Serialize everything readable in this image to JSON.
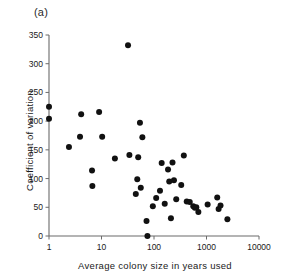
{
  "panel": {
    "label": "(a)"
  },
  "chart_data": {
    "type": "scatter",
    "title": "",
    "subtitle": "",
    "xlabel": "Average colony size in years used",
    "ylabel": "Coefficient of variation",
    "xscale": "log",
    "yscale": "linear",
    "xlim": [
      1,
      10000
    ],
    "ylim": [
      0,
      350
    ],
    "xticks": [
      1,
      10,
      100,
      1000,
      10000
    ],
    "xtick_labels": [
      "1",
      "10",
      "100",
      "1000",
      "10000"
    ],
    "yticks": [
      0,
      50,
      100,
      150,
      200,
      250,
      300,
      350
    ],
    "ytick_labels": [
      "0",
      "50",
      "100",
      "150",
      "200",
      "250",
      "300",
      "350"
    ],
    "grid": false,
    "legend": null,
    "marker": "filled-circle",
    "marker_color": "#111111",
    "points": [
      {
        "x": 1.0,
        "y": 225
      },
      {
        "x": 1.0,
        "y": 204
      },
      {
        "x": 2.4,
        "y": 155
      },
      {
        "x": 3.9,
        "y": 173
      },
      {
        "x": 4.1,
        "y": 212
      },
      {
        "x": 6.6,
        "y": 114
      },
      {
        "x": 6.7,
        "y": 87
      },
      {
        "x": 9.0,
        "y": 216
      },
      {
        "x": 10.3,
        "y": 173
      },
      {
        "x": 18.0,
        "y": 135
      },
      {
        "x": 32.0,
        "y": 332
      },
      {
        "x": 34.0,
        "y": 141
      },
      {
        "x": 45.0,
        "y": 73
      },
      {
        "x": 48.0,
        "y": 99
      },
      {
        "x": 50.0,
        "y": 137
      },
      {
        "x": 54.0,
        "y": 197
      },
      {
        "x": 56.0,
        "y": 84
      },
      {
        "x": 60.0,
        "y": 172
      },
      {
        "x": 72.0,
        "y": 26
      },
      {
        "x": 75.0,
        "y": 0
      },
      {
        "x": 95.0,
        "y": 52
      },
      {
        "x": 110.0,
        "y": 66
      },
      {
        "x": 130.0,
        "y": 79
      },
      {
        "x": 140.0,
        "y": 127
      },
      {
        "x": 160.0,
        "y": 56
      },
      {
        "x": 185.0,
        "y": 116
      },
      {
        "x": 195.0,
        "y": 95
      },
      {
        "x": 210.0,
        "y": 31
      },
      {
        "x": 225.0,
        "y": 128
      },
      {
        "x": 240.0,
        "y": 97
      },
      {
        "x": 265.0,
        "y": 64
      },
      {
        "x": 330.0,
        "y": 89
      },
      {
        "x": 370.0,
        "y": 140
      },
      {
        "x": 420.0,
        "y": 60
      },
      {
        "x": 480.0,
        "y": 59
      },
      {
        "x": 560.0,
        "y": 52
      },
      {
        "x": 600.0,
        "y": 49
      },
      {
        "x": 640.0,
        "y": 50
      },
      {
        "x": 700.0,
        "y": 42
      },
      {
        "x": 1050.0,
        "y": 55
      },
      {
        "x": 1600.0,
        "y": 67
      },
      {
        "x": 1700.0,
        "y": 47
      },
      {
        "x": 1850.0,
        "y": 53
      },
      {
        "x": 2500.0,
        "y": 29
      }
    ]
  }
}
